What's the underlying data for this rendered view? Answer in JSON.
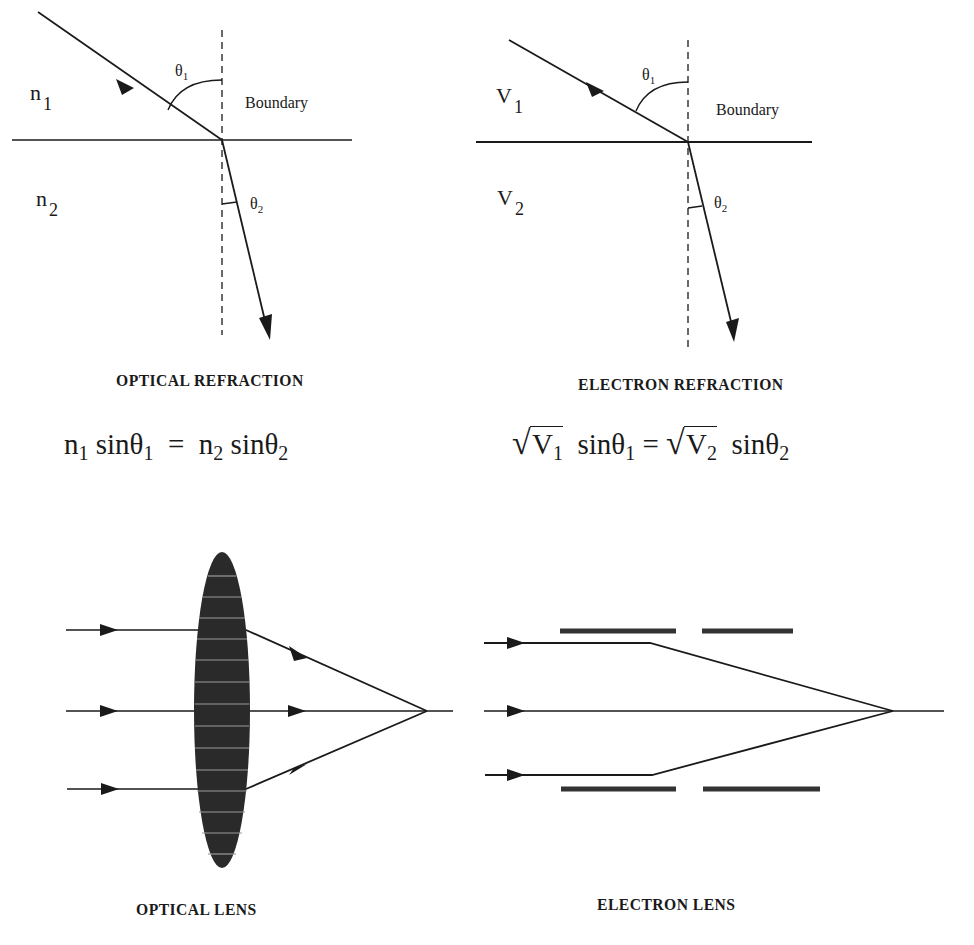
{
  "panels": {
    "optical_refraction": {
      "medium_top": {
        "symbol": "n",
        "sub": "1"
      },
      "medium_bottom": {
        "symbol": "n",
        "sub": "2"
      },
      "theta1": {
        "symbol": "θ",
        "sub": "1"
      },
      "theta2": {
        "symbol": "θ",
        "sub": "2"
      },
      "boundary_label": "Boundary",
      "caption": "OPTICAL REFRACTION",
      "equation": {
        "lhs_coef": "n",
        "lhs_coef_sub": "1",
        "lhs_func": "sinθ",
        "lhs_func_sub": "1",
        "eq": "=",
        "rhs_coef": "n",
        "rhs_coef_sub": "2",
        "rhs_func": "sinθ",
        "rhs_func_sub": "2"
      }
    },
    "electron_refraction": {
      "medium_top": {
        "symbol": "V",
        "sub": "1"
      },
      "medium_bottom": {
        "symbol": "V",
        "sub": "2"
      },
      "theta1": {
        "symbol": "θ",
        "sub": "1"
      },
      "theta2": {
        "symbol": "θ",
        "sub": "2"
      },
      "boundary_label": "Boundary",
      "caption": "ELECTRON REFRACTION",
      "equation": {
        "radical": "√",
        "lhs_coef": "V",
        "lhs_coef_sub": "1",
        "lhs_func": "sinθ",
        "lhs_func_sub": "1",
        "eq": "=",
        "rhs_coef": "V",
        "rhs_coef_sub": "2",
        "rhs_func": "sinθ",
        "rhs_func_sub": "2"
      }
    },
    "optical_lens": {
      "caption": "OPTICAL LENS"
    },
    "electron_lens": {
      "caption": "ELECTRON LENS"
    }
  },
  "colors": {
    "ink": "#1a1a1a",
    "lens_fill": "#2a2a2a",
    "lens_stripe": "#9a9a9a",
    "background": "#ffffff"
  }
}
